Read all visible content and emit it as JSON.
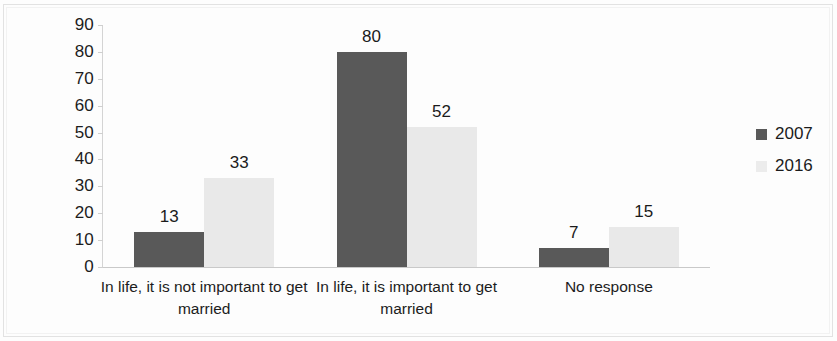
{
  "chart_data": {
    "type": "bar",
    "title": "",
    "subtitle": "",
    "xlabel": "",
    "ylabel": "",
    "ylim": [
      0,
      90
    ],
    "y_ticks": [
      "0",
      "10",
      "20",
      "30",
      "40",
      "50",
      "60",
      "70",
      "80",
      "90"
    ],
    "grid": false,
    "legend_position": "right",
    "categories": [
      "In life, it is not important to get married",
      "In life, it is important to get married",
      "No response"
    ],
    "series": [
      {
        "name": "2007",
        "color": "#595959",
        "values": [
          13,
          80,
          7
        ]
      },
      {
        "name": "2016",
        "color": "#e9e9e9",
        "values": [
          33,
          52,
          15
        ]
      }
    ],
    "data_labels": [
      [
        "13",
        "33"
      ],
      [
        "80",
        "52"
      ],
      [
        "7",
        "15"
      ]
    ]
  },
  "legend": {
    "items": [
      {
        "label": "2007",
        "swatch": "legend-swatch-2007"
      },
      {
        "label": "2016",
        "swatch": "legend-swatch-2016"
      }
    ]
  }
}
